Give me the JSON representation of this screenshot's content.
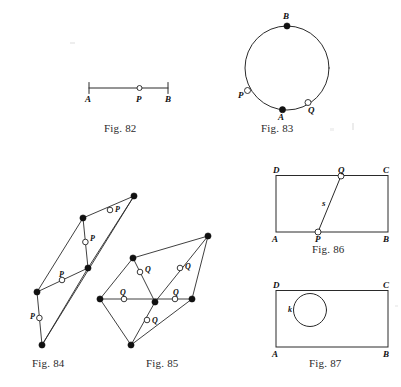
{
  "page": {
    "background": "#ffffff",
    "ink": "#1a1a1a"
  },
  "captions": {
    "fig82": "Fig. 82",
    "fig83": "Fig. 83",
    "fig84": "Fig. 84",
    "fig85": "Fig. 85",
    "fig86": "Fig. 86",
    "fig87": "Fig. 87"
  },
  "figures": [
    {
      "id": "fig82",
      "caption": "Fig. 82",
      "kind": "segment",
      "labels": [
        "A",
        "P",
        "B"
      ],
      "description": "Segment AB with tick ends and open midpoint marker P"
    },
    {
      "id": "fig83",
      "caption": "Fig. 83",
      "kind": "circle",
      "labels": [
        "B",
        "P",
        "A",
        "Q"
      ],
      "filled_points": [
        "B",
        "A"
      ],
      "open_points": [
        "P",
        "Q"
      ],
      "description": "Circle with filled points A (bottom) and B (top), open points P (left) and Q (lower right)"
    },
    {
      "id": "fig84",
      "caption": "Fig. 84",
      "kind": "polygon-network",
      "labels": [
        "P",
        "P",
        "P",
        "P"
      ],
      "open_point_count": 4,
      "filled_vertex_count": 5,
      "description": "Two overlapping triangles with four open points labelled P"
    },
    {
      "id": "fig85",
      "caption": "Fig. 85",
      "kind": "polygon-network",
      "labels": [
        "Q",
        "Q",
        "Q",
        "Q"
      ],
      "open_point_count": 4,
      "filled_vertex_count": 6,
      "description": "Quadrilateral network with four open points labelled Q"
    },
    {
      "id": "fig86",
      "caption": "Fig. 86",
      "kind": "rectangle-with-line",
      "labels": [
        "D",
        "Q",
        "C",
        "s",
        "A",
        "P",
        "B"
      ],
      "corner_labels": [
        "A",
        "B",
        "C",
        "D"
      ],
      "open_points": [
        "P",
        "Q"
      ],
      "line_label": "s",
      "description": "Rectangle ABCD with line s from P on AB to Q on DC"
    },
    {
      "id": "fig87",
      "caption": "Fig. 87",
      "kind": "rectangle-with-circle",
      "labels": [
        "D",
        "C",
        "k",
        "A",
        "B"
      ],
      "corner_labels": [
        "A",
        "B",
        "C",
        "D"
      ],
      "circle_label": "k",
      "description": "Rectangle ABCD containing circle k"
    }
  ],
  "point_labels": {
    "fig82": {
      "A": "A",
      "P": "P",
      "B": "B"
    },
    "fig83": {
      "B": "B",
      "A": "A",
      "P": "P",
      "Q": "Q"
    },
    "fig84": {
      "p1": "P",
      "p2": "P",
      "p3": "P",
      "p4": "P"
    },
    "fig85": {
      "q1": "Q",
      "q2": "Q",
      "q3": "Q",
      "q4": "Q"
    },
    "fig86": {
      "D": "D",
      "C": "C",
      "A": "A",
      "B": "B",
      "P": "P",
      "Q": "Q",
      "s": "s"
    },
    "fig87": {
      "D": "D",
      "C": "C",
      "A": "A",
      "B": "B",
      "k": "k"
    }
  }
}
